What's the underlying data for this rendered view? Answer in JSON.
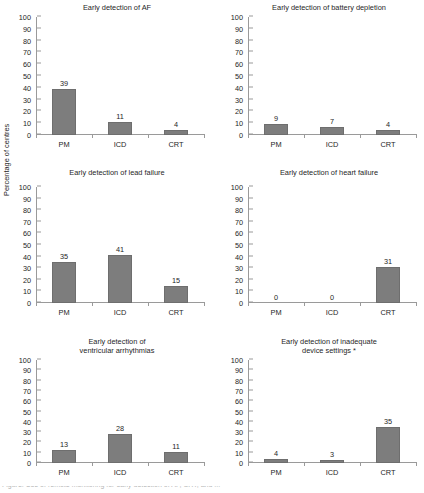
{
  "chart_data": {
    "type": "bar",
    "categories": [
      "PM",
      "ICD",
      "CRT"
    ],
    "ylabel": "Percentage of centres",
    "xlabel": "",
    "ylim": [
      0,
      100
    ],
    "ytick_step": 10,
    "yticks": [
      0,
      10,
      20,
      30,
      40,
      50,
      60,
      70,
      80,
      90,
      100
    ],
    "grid": false,
    "legend": "none",
    "bar_color": "#7d7d7d",
    "panels": [
      {
        "title": "Early detection of AF",
        "title_lines": [
          "Early detection of AF"
        ],
        "values": [
          39,
          11,
          4
        ]
      },
      {
        "title": "Early detection of battery depletion",
        "title_lines": [
          "Early detection of battery depletion"
        ],
        "values": [
          9,
          7,
          4
        ]
      },
      {
        "title": "Early detection of lead failure",
        "title_lines": [
          "Early detection of lead failure"
        ],
        "values": [
          35,
          41,
          15
        ]
      },
      {
        "title": "Early detection of heart failure",
        "title_lines": [
          "Early detection of heart failure"
        ],
        "values": [
          0,
          0,
          31
        ]
      },
      {
        "title": "Early detection of ventricular arrhythmias",
        "title_lines": [
          "Early detection of",
          "ventricular arrhythmias"
        ],
        "values": [
          13,
          28,
          11
        ]
      },
      {
        "title": "Early detection of inadequate device settings *",
        "title_lines": [
          "Early detection of inadequate",
          "device settings *"
        ],
        "values": [
          4,
          3,
          35
        ]
      }
    ]
  },
  "figure": {
    "axis_title": "Percentage of centres",
    "caption_clipped": "Figure. Use of remote monitoring for early detection of AF, CRT, and ..."
  }
}
